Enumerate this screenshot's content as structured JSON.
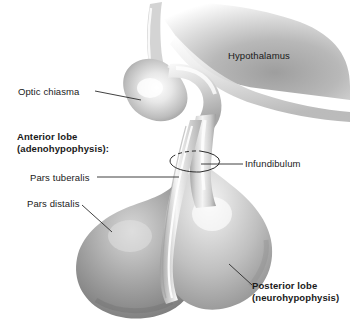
{
  "figure": {
    "background_color": "#ffffff",
    "text_color": "#1a1a1a",
    "leader_line_color": "#2b2b2b"
  },
  "labels": {
    "hypothalamus": "Hypothalamus",
    "optic_chiasma": "Optic chiasma",
    "anterior_lobe_line1": "Anterior lobe",
    "anterior_lobe_line2": "(adenohypophysis):",
    "pars_tuberalis": "Pars tuberalis",
    "pars_distalis": "Pars distalis",
    "infundibulum": "Infundibulum",
    "posterior_lobe_line1": "Posterior lobe",
    "posterior_lobe_line2": "(neurohypophysis)"
  },
  "structures": [
    {
      "name": "hypothalamus",
      "label": "Hypothalamus",
      "style": "soft gray mass fading to white, upper right"
    },
    {
      "name": "optic-chiasma",
      "label": "Optic chiasma",
      "style": "rounded club-shaped lobe, upper left"
    },
    {
      "name": "infundibulum",
      "label": "Infundibulum",
      "style": "stalk marked by dashed-top ellipse"
    },
    {
      "name": "pars-tuberalis",
      "label": "Pars tuberalis",
      "style": "thin pale band on left of stalk"
    },
    {
      "name": "pars-distalis",
      "label": "Pars distalis",
      "style": "large darker gray left lobe"
    },
    {
      "name": "posterior-lobe",
      "label": "Posterior lobe",
      "style": "large lighter gray right lobe"
    }
  ],
  "palette": {
    "tissue_light": "#f2f2f2",
    "tissue_mid": "#c9c9c9",
    "tissue_dark": "#8e8e8e",
    "tissue_darkest": "#6f6f6f",
    "outline": "#8a8a8a"
  }
}
